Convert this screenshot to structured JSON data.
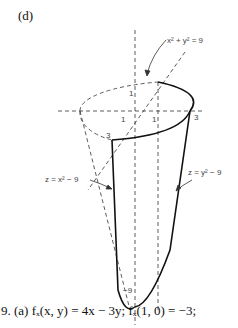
{
  "figure": {
    "panel_label": "(d)",
    "annotations": {
      "circle_eq": "x² + y² = 9",
      "left_surface": "z = x² − 9",
      "right_surface": "z = y² − 9",
      "tick_1_z": "1",
      "tick_1_x": "1",
      "tick_1_y": "1",
      "tick_3_left": "3",
      "tick_3_right": "3",
      "tick_neg9": "−9"
    }
  },
  "answer": {
    "text": "9. (a) fₓ(x, y) = 4x − 3y; fₓ(1, 0) = −3;"
  }
}
